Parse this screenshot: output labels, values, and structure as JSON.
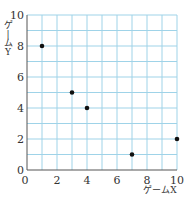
{
  "chart_data": {
    "type": "scatter",
    "title": "",
    "xlabel": "ゲームX",
    "ylabel": "ゲームY",
    "xlim": [
      0,
      10
    ],
    "ylim": [
      0,
      10
    ],
    "x_ticks": [
      0,
      2,
      4,
      6,
      8,
      10
    ],
    "y_ticks": [
      0,
      2,
      4,
      6,
      8,
      10
    ],
    "grid": true,
    "grid_minor_step": 1,
    "points": [
      {
        "x": 1,
        "y": 8
      },
      {
        "x": 3,
        "y": 5
      },
      {
        "x": 4,
        "y": 4
      },
      {
        "x": 7,
        "y": 1
      },
      {
        "x": 10,
        "y": 2
      }
    ],
    "colors": {
      "grid": "#9fd3e8",
      "axis": "#555555",
      "point": "#111111"
    }
  }
}
